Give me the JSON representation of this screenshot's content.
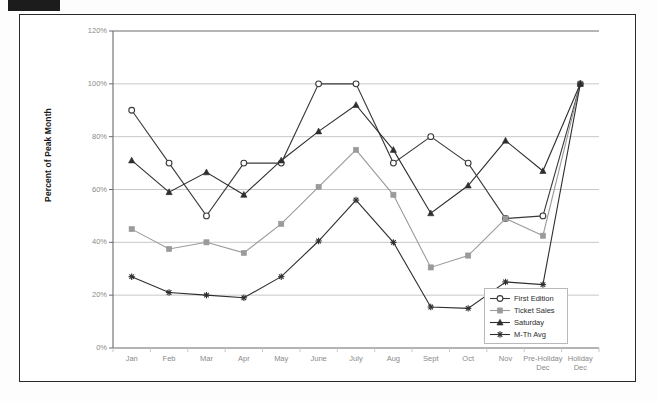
{
  "chart_data": {
    "type": "line",
    "title": "",
    "xlabel": "",
    "ylabel": "Percent of Peak Month",
    "categories": [
      "Jan",
      "Feb",
      "Mar",
      "Apr",
      "May",
      "June",
      "July",
      "Aug",
      "Sept",
      "Oct",
      "Nov",
      "Pre-Holiday Dec",
      "Holiday Dec"
    ],
    "category_lines": [
      [
        "Jan"
      ],
      [
        "Feb"
      ],
      [
        "Mar"
      ],
      [
        "Apr"
      ],
      [
        "May"
      ],
      [
        "June"
      ],
      [
        "July"
      ],
      [
        "Aug"
      ],
      [
        "Sept"
      ],
      [
        "Oct"
      ],
      [
        "Nov"
      ],
      [
        "Pre-Holiday",
        "Dec"
      ],
      [
        "Holiday",
        "Dec"
      ]
    ],
    "ylim": [
      0,
      120
    ],
    "yticks": [
      0,
      20,
      40,
      60,
      80,
      100,
      120
    ],
    "ytick_labels": [
      "0%",
      "20%",
      "40%",
      "60%",
      "80%",
      "100%",
      "120%"
    ],
    "grid": "horizontal",
    "legend_position": "inside-bottom-right",
    "series": [
      {
        "name": "First Edition",
        "marker": "open-circle",
        "color": "#3a3a3a",
        "values": [
          90,
          70,
          50,
          70,
          70,
          100,
          100,
          70,
          80,
          70,
          49,
          50,
          100
        ]
      },
      {
        "name": "Ticket Sales",
        "marker": "filled-square",
        "color": "#9a9a9a",
        "values": [
          45,
          37.5,
          40,
          36,
          47,
          61,
          75,
          58,
          30.5,
          35,
          49,
          42.5,
          100
        ]
      },
      {
        "name": "Saturday",
        "marker": "filled-triangle",
        "color": "#2e2e2e",
        "values": [
          71,
          59,
          66.5,
          58,
          71,
          82,
          92,
          75,
          51,
          61.5,
          78.5,
          67,
          100
        ]
      },
      {
        "name": "M-Th Avg",
        "marker": "star-cross",
        "color": "#2e2e2e",
        "values": [
          27,
          21,
          20,
          19,
          27,
          40.5,
          56,
          40,
          15.5,
          15,
          25,
          24,
          100
        ]
      }
    ]
  },
  "legend": {
    "entries": [
      {
        "label": "First Edition"
      },
      {
        "label": "Ticket Sales"
      },
      {
        "label": "Saturday"
      },
      {
        "label": "M-Th Avg"
      }
    ]
  },
  "axis": {
    "y_title": "Percent of Peak Month"
  },
  "colors": {
    "grid": "#c8c8c8",
    "axis": "#6b6b6b",
    "tick_text": "#8a8a8a",
    "frame": "#2a2a2a",
    "series_dark": "#2e2e2e",
    "series_gray": "#9a9a9a"
  }
}
